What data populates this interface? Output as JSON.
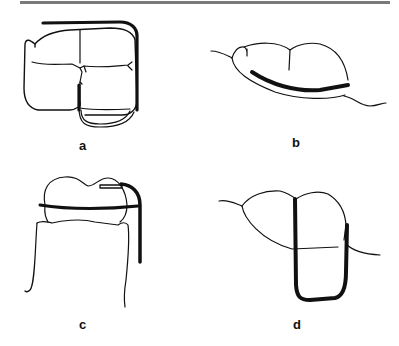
{
  "figure": {
    "top_rule_color": "#7a7a7a",
    "line_color": "#111111",
    "panels": [
      {
        "id": "a",
        "label": "a",
        "description": "Occlusal view of molar with matrix band wrapping around distal and buccal"
      },
      {
        "id": "b",
        "label": "b",
        "description": "Lateral view of tooth with curved thick band along cervical margin"
      },
      {
        "id": "c",
        "label": "c",
        "description": "Proximal view of crown with horizontal band and vertical retainer"
      },
      {
        "id": "d",
        "label": "d",
        "description": "Tooth with U-shaped thick band loop below crown"
      }
    ]
  }
}
